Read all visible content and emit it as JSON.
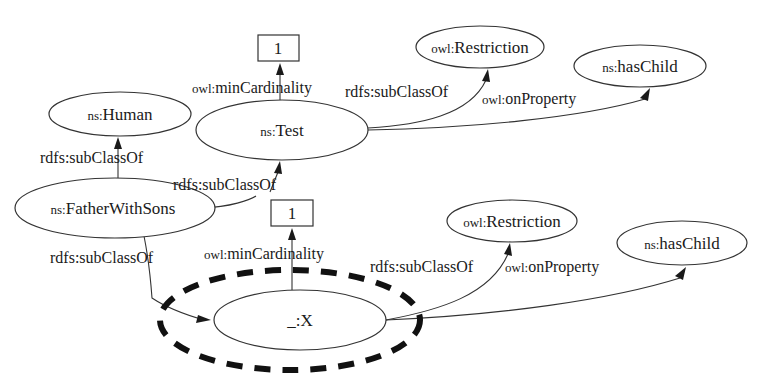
{
  "diagram": {
    "title": "",
    "nodes": {
      "box_top": {
        "label": "1",
        "shape": "rect"
      },
      "test": {
        "prefix": "ns:",
        "name": "Test",
        "shape": "ellipse"
      },
      "restriction_top": {
        "prefix": "owl:",
        "name": "Restriction",
        "shape": "ellipse"
      },
      "haschild_top": {
        "prefix": "ns:",
        "name": "hasChild",
        "shape": "ellipse"
      },
      "human": {
        "prefix": "ns:",
        "name": "Human",
        "shape": "ellipse"
      },
      "father": {
        "prefix": "ns:",
        "name": "FatherWithSons",
        "shape": "ellipse"
      },
      "box_bottom": {
        "label": "1",
        "shape": "rect"
      },
      "x": {
        "prefix": "_:",
        "name": "X",
        "shape": "ellipse",
        "highlighted": true
      },
      "restriction_bottom": {
        "prefix": "owl:",
        "name": "Restriction",
        "shape": "ellipse"
      },
      "haschild_bottom": {
        "prefix": "ns:",
        "name": "hasChild",
        "shape": "ellipse"
      }
    },
    "edges": {
      "test_mincard": {
        "prefix": "owl:",
        "name": "minCardinality",
        "from": "ns:Test",
        "to": "1"
      },
      "test_subclass": {
        "prefix": "rdfs:",
        "name": "subClassOf",
        "from": "ns:Test",
        "to": "owl:Restriction"
      },
      "test_onprop": {
        "prefix": "owl:",
        "name": "onProperty",
        "from": "ns:Test",
        "to": "ns:hasChild"
      },
      "father_human": {
        "prefix": "rdfs:",
        "name": "subClassOf",
        "from": "ns:FatherWithSons",
        "to": "ns:Human"
      },
      "father_test": {
        "prefix": "rdfs:",
        "name": "subClassOf",
        "from": "ns:FatherWithSons",
        "to": "ns:Test"
      },
      "father_x": {
        "prefix": "rdfs:",
        "name": "subClassOf",
        "from": "ns:FatherWithSons",
        "to": "_:X"
      },
      "x_mincard": {
        "prefix": "owl:",
        "name": "minCardinality",
        "from": "_:X",
        "to": "1"
      },
      "x_subclass": {
        "prefix": "rdfs:",
        "name": "subClassOf",
        "from": "_:X",
        "to": "owl:Restriction"
      },
      "x_onprop": {
        "prefix": "owl:",
        "name": "onProperty",
        "from": "_:X",
        "to": "ns:hasChild"
      }
    },
    "colors": {
      "stroke": "#333333",
      "text": "#1a1a1a",
      "background": "#ffffff",
      "highlight": "#111111"
    }
  }
}
